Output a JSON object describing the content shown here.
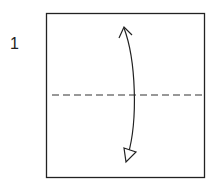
{
  "diagram": {
    "type": "origami-step",
    "step_number": "1",
    "paper": {
      "x": 46,
      "y": 13,
      "width": 159,
      "height": 165,
      "stroke": "#222222"
    },
    "valley_fold_line": {
      "orientation": "horizontal",
      "y": 95,
      "x1": 52,
      "x2": 204,
      "style": "dashed",
      "stroke": "#333333"
    },
    "fold_arrow": {
      "type": "fold-and-unfold",
      "from": "top",
      "to": "bottom",
      "stroke": "#222222"
    }
  }
}
